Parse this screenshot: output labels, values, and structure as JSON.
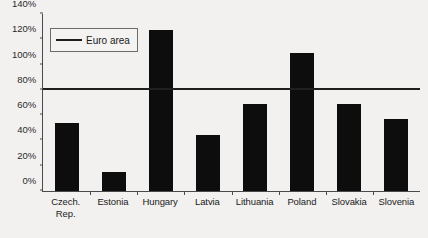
{
  "chart_data": {
    "type": "bar",
    "title": "",
    "subtitle": "",
    "xlabel": "",
    "ylabel": "",
    "categories": [
      "Czech Rep.",
      "Estonia",
      "Hungary",
      "Latvia",
      "Lithuania",
      "Poland",
      "Slovakia",
      "Slovenia"
    ],
    "category_lines": [
      [
        "Czech.",
        "Rep."
      ],
      [
        "Estonia"
      ],
      [
        "Hungary"
      ],
      [
        "Latvia"
      ],
      [
        "Lithuania"
      ],
      [
        "Poland"
      ],
      [
        "Slovakia"
      ],
      [
        "Slovenia"
      ]
    ],
    "values": [
      54,
      15,
      127,
      44,
      69,
      109,
      69,
      57
    ],
    "value_unit": "%",
    "ylim": [
      0,
      140
    ],
    "yticks": [
      0,
      20,
      40,
      60,
      80,
      100,
      120,
      140
    ],
    "ytick_labels": [
      "0%",
      "20%",
      "40%",
      "60%",
      "80%",
      "100%",
      "120%",
      "140%"
    ],
    "grid": false,
    "legend_position": "top-left",
    "series": [
      {
        "name": "bars",
        "type": "bar",
        "color": "#0d0d0d",
        "values": [
          54,
          15,
          127,
          44,
          69,
          109,
          69,
          57
        ]
      },
      {
        "name": "Euro area",
        "type": "reference-line",
        "color": "#1f1f1f",
        "value": 80
      }
    ],
    "annotations": []
  },
  "legend": {
    "items": [
      {
        "label": "Euro area",
        "color": "#1f1f1f"
      }
    ]
  },
  "colors": {
    "bar": "#0d0d0d",
    "line": "#1f1f1f",
    "axis": "#4a4a4a",
    "background": "#f2f1ef",
    "text": "#1b1b1b"
  }
}
